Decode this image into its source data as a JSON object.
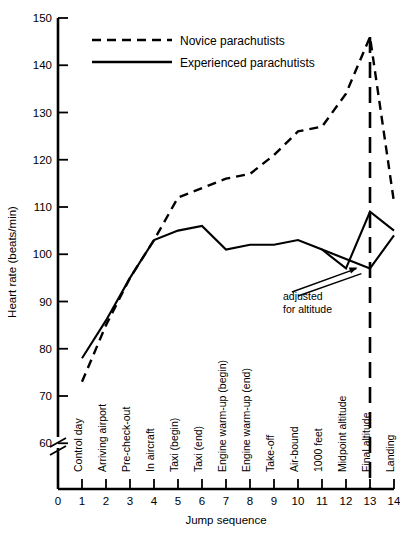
{
  "chart_data": {
    "type": "line",
    "title": "",
    "xlabel": "Jump sequence",
    "ylabel": "Heart rate (beats/min)",
    "xlim": [
      0,
      14
    ],
    "ylim": [
      55,
      150
    ],
    "ytick_labels": [
      "150",
      "140",
      "130",
      "120",
      "110",
      "100",
      "90",
      "80",
      "70",
      "60"
    ],
    "ytick_values": [
      150,
      140,
      130,
      120,
      110,
      100,
      90,
      80,
      70,
      60
    ],
    "xtick_labels": [
      "0",
      "1",
      "2",
      "3",
      "4",
      "5",
      "6",
      "7",
      "8",
      "9",
      "10",
      "11",
      "12",
      "13",
      "14"
    ],
    "xtick_values": [
      0,
      1,
      2,
      3,
      4,
      5,
      6,
      7,
      8,
      9,
      10,
      11,
      12,
      13,
      14
    ],
    "axis_break": true,
    "grid": false,
    "legend_position": "top-center",
    "categories": [
      "Control day",
      "Arriving airport",
      "Pre-check-out",
      "In aircraft",
      "Taxi (begin)",
      "Taxi (end)",
      "Engine warm-up (begin)",
      "Engine warm-up (end)",
      "Take-off",
      "Air-bound",
      "1000 feet",
      "Midpoint altitude",
      "Final altitude",
      "Landing"
    ],
    "category_x": [
      1,
      2,
      3,
      4,
      5,
      6,
      7,
      8,
      9,
      10,
      11,
      12,
      13,
      14
    ],
    "series": [
      {
        "name": "Novice parachutists",
        "style": "dashed",
        "x": [
          1,
          2,
          3,
          4,
          5,
          6,
          7,
          8,
          9,
          10,
          11,
          12,
          13,
          14
        ],
        "values": [
          73,
          85,
          95,
          103,
          112,
          114,
          116,
          117,
          121,
          126,
          127,
          134,
          146,
          111
        ]
      },
      {
        "name": "Experienced parachutists",
        "style": "solid",
        "x": [
          1,
          2,
          3,
          4,
          5,
          6,
          7,
          8,
          9,
          10,
          11,
          12,
          13,
          14
        ],
        "values": [
          78,
          86,
          95,
          103,
          105,
          106,
          101,
          102,
          102,
          103,
          101,
          97,
          109,
          105
        ]
      },
      {
        "name": "adjusted for altitude",
        "style": "solid",
        "x": [
          11,
          12,
          13,
          14
        ],
        "values": [
          101,
          99,
          97,
          104
        ]
      }
    ],
    "annotations": [
      {
        "text_line1": "adjusted",
        "text_line2": "for altitude",
        "points_to_x": 12.6,
        "points_to_y": 97.8
      }
    ],
    "vertical_marker": {
      "x": 13,
      "style": "long-dashed",
      "label": "Final altitude"
    }
  },
  "legend": {
    "items": [
      {
        "label": "Novice parachutists",
        "style": "dashed"
      },
      {
        "label": "Experienced parachutists",
        "style": "solid"
      }
    ]
  }
}
